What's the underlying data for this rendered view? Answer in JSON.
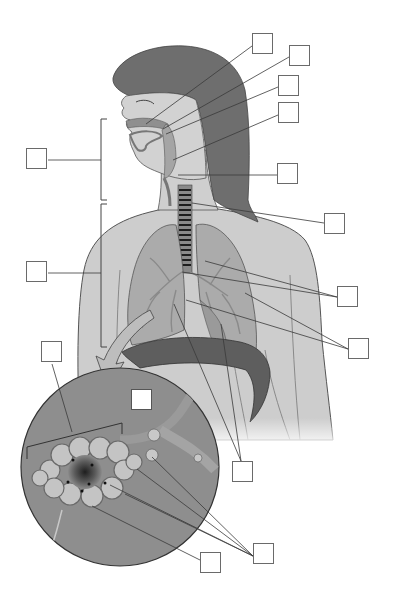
{
  "diagram": {
    "style": "grayscale anatomical illustration with blank label boxes",
    "colors": {
      "background": "#ffffff",
      "skin": "#c9c9c9",
      "hair": "#6e6e6e",
      "lung": "#a9a9a9",
      "diaphragm": "#5e5e5e",
      "trachea_rings": "#2a2a2a",
      "inset_circle": "#8c8c8c",
      "leader_line": "#3a3a3a",
      "box_border": "#6a6a6a"
    },
    "regions": {
      "upper_bracket": "Upper respiratory tract (bracket spanning nasal cavity to larynx)",
      "lower_bracket": "Lower respiratory tract (bracket spanning trachea to lungs)",
      "inset": "Magnified alveoli cluster with arrow from lung"
    },
    "label_boxes": [
      {
        "id": "box-1",
        "points_to": "nasal cavity",
        "text": ""
      },
      {
        "id": "box-2",
        "points_to": "nasopharynx",
        "text": ""
      },
      {
        "id": "box-3",
        "points_to": "pharynx",
        "text": ""
      },
      {
        "id": "box-4",
        "points_to": "oropharynx / epiglottis",
        "text": ""
      },
      {
        "id": "box-5",
        "points_to": "larynx",
        "text": ""
      },
      {
        "id": "box-6",
        "points_to": "trachea",
        "text": ""
      },
      {
        "id": "box-7",
        "points_to": "bronchi",
        "text": ""
      },
      {
        "id": "box-8",
        "points_to": "bronchioles / lungs",
        "text": ""
      },
      {
        "id": "box-9",
        "points_to": "lungs / diaphragm",
        "text": ""
      },
      {
        "id": "box-10",
        "points_to": "alveoli / capillaries",
        "text": ""
      },
      {
        "id": "box-11",
        "points_to": "alveolar sac",
        "text": ""
      },
      {
        "id": "box-upper-tract",
        "points_to": "upper respiratory tract bracket",
        "text": ""
      },
      {
        "id": "box-lower-tract",
        "points_to": "lower respiratory tract bracket",
        "text": ""
      },
      {
        "id": "box-alveoli-bracket",
        "points_to": "alveolar cluster bracket",
        "text": ""
      },
      {
        "id": "box-inset",
        "points_to": "inset magnification",
        "text": ""
      }
    ],
    "ghost_text": ""
  }
}
